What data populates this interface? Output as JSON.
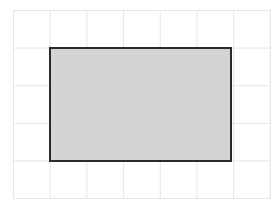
{
  "canvas": {
    "background": "#ffffff",
    "grid": {
      "color": "#e6e6e6",
      "columns": 7,
      "rows": 5
    }
  },
  "shapes": [
    {
      "type": "rectangle",
      "x": 49,
      "y": 47,
      "width": 183,
      "height": 115,
      "fill": "#d4d4d4",
      "stroke": "#2a2a2a"
    }
  ]
}
